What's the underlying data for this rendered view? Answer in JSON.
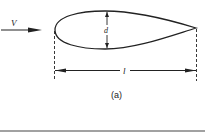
{
  "figure": {
    "velocity_label": "V",
    "thickness_label": "d",
    "length_label": "l",
    "caption": "(a)"
  },
  "colors": {
    "stroke": "#222222",
    "background": "#ffffff"
  }
}
